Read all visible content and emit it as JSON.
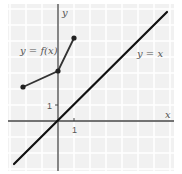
{
  "chart_data": {
    "type": "line",
    "title": "",
    "xlabel": "x",
    "ylabel": "y",
    "grid": true,
    "x_ticks": [
      {
        "value": 1,
        "label": "1"
      }
    ],
    "y_ticks": [
      {
        "value": 1,
        "label": "1"
      }
    ],
    "xlim": [
      -3.0,
      7.0
    ],
    "ylim": [
      -3.0,
      7.2
    ],
    "series": [
      {
        "name": "y = f(x)",
        "style": "segments-with-dots",
        "points": [
          [
            -2.2,
            2.1
          ],
          [
            0,
            3.1
          ],
          [
            1,
            5.2
          ]
        ]
      },
      {
        "name": "y = x",
        "style": "line",
        "points": [
          [
            -2.7,
            -2.7
          ],
          [
            6.8,
            6.8
          ]
        ]
      }
    ],
    "annotations": [
      {
        "text": "y = f(x)",
        "near": [
          -1.3,
          4.0
        ]
      },
      {
        "text": "y = x",
        "near": [
          4.5,
          3.9
        ]
      }
    ]
  },
  "labels": {
    "x_axis": "x",
    "y_axis": "y",
    "f_label": "y = f(x)",
    "identity_label": "y = x",
    "x_tick": "1",
    "y_tick": "1"
  },
  "colors": {
    "background": "#f1f1f1",
    "grid": "#ffffff",
    "axis": "#444444",
    "curve": "#333333",
    "identity": "#111111"
  }
}
